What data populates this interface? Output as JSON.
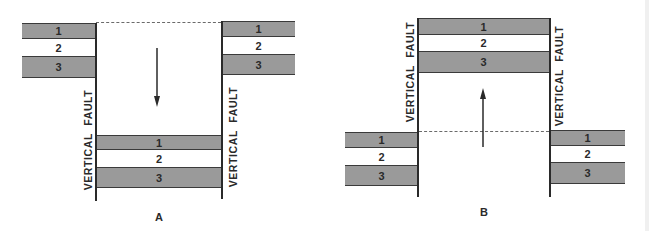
{
  "colors": {
    "shaded_layer": "#9a9a9a",
    "plain_layer": "#ffffff",
    "line": "#2a2a2a",
    "dashed": "#6a6a6a"
  },
  "panel_a": {
    "label": "A",
    "fault_label_left": "VERTICAL FAULT",
    "fault_label_right": "VERTICAL FAULT",
    "arrow": "down-arrow",
    "left_block": {
      "layers": [
        "1",
        "2",
        "3"
      ]
    },
    "right_block": {
      "layers": [
        "1",
        "2",
        "3"
      ]
    },
    "center_block": {
      "layers": [
        "1",
        "2",
        "3"
      ]
    }
  },
  "panel_b": {
    "label": "B",
    "fault_label_left": "VERTICAL FAULT",
    "fault_label_right": "VERTICAL FAULT",
    "arrow": "up-arrow",
    "left_block": {
      "layers": [
        "1",
        "2",
        "3"
      ]
    },
    "right_block": {
      "layers": [
        "1",
        "2",
        "3"
      ]
    },
    "center_block": {
      "layers": [
        "1",
        "2",
        "3"
      ]
    }
  }
}
